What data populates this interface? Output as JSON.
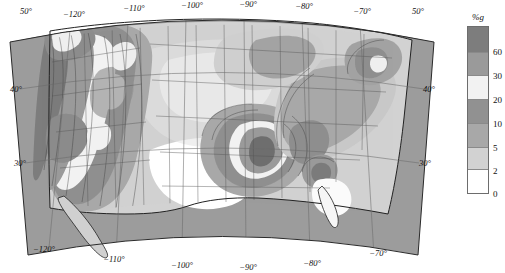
{
  "figure": {
    "kind": "seismic-hazard-map",
    "projection": "lambert-conformal-conic",
    "region": "contiguous-united-states"
  },
  "legend": {
    "title": "%g",
    "tick_labels": [
      "60",
      "30",
      "20",
      "10",
      "5",
      "2",
      "0"
    ],
    "bands": [
      {
        "label": ">60",
        "upper": null,
        "lower": 60,
        "color": "#7d7d7d",
        "height_px": 26
      },
      {
        "label": "30-60",
        "upper": 60,
        "lower": 30,
        "color": "#9a9a9a",
        "height_px": 24
      },
      {
        "label": "20-30",
        "upper": 30,
        "lower": 20,
        "color": "#f2f2f2",
        "height_px": 24
      },
      {
        "label": "10-20",
        "upper": 20,
        "lower": 10,
        "color": "#919191",
        "height_px": 24
      },
      {
        "label": "5-10",
        "upper": 10,
        "lower": 5,
        "color": "#a8a8a8",
        "height_px": 24
      },
      {
        "label": "2-5",
        "upper": 5,
        "lower": 2,
        "color": "#d2d2d2",
        "height_px": 23
      },
      {
        "label": "0-2",
        "upper": 2,
        "lower": 0,
        "color": "#ffffff",
        "height_px": 23
      }
    ]
  },
  "axes": {
    "top_labels": [
      "50°",
      "−120°",
      "−110°",
      "−100°",
      "−90°",
      "−80°",
      "−70°",
      "50°"
    ],
    "bottom_labels": [
      "−120°",
      "−110°",
      "−100°",
      "−90°",
      "−80°",
      "−70°"
    ],
    "left_labels": [
      "40°",
      "30°"
    ],
    "right_labels": [
      "40°",
      "30°"
    ],
    "longitude_ticks": [
      -120,
      -110,
      -100,
      -90,
      -80,
      -70
    ],
    "latitude_ticks": [
      30,
      40,
      50
    ]
  },
  "chart_data": {
    "type": "heatmap",
    "title": "",
    "xlabel": "",
    "ylabel": "",
    "units": "%g",
    "variable": "peak-ground-acceleration",
    "contour_levels": [
      0,
      2,
      5,
      10,
      20,
      30,
      60
    ],
    "colors": [
      "#ffffff",
      "#d2d2d2",
      "#a8a8a8",
      "#919191",
      "#f2f2f2",
      "#9a9a9a",
      "#7d7d7d"
    ],
    "ocean_color": "#9c9c9c",
    "grid": true,
    "legend_position": "right",
    "hazard_zones": [
      {
        "name": "coastal-california-san-andreas",
        "peak_band": ">60",
        "lon": -121.5,
        "lat": 37.0
      },
      {
        "name": "southern-california",
        "peak_band": ">60",
        "lon": -117.5,
        "lat": 34.0
      },
      {
        "name": "cascadia-pacific-northwest",
        "peak_band": "30-60",
        "lon": -123.0,
        "lat": 46.5
      },
      {
        "name": "nevada-basin-and-range",
        "peak_band": "20-30",
        "lon": -117.0,
        "lat": 39.0
      },
      {
        "name": "wasatch-front-utah",
        "peak_band": "20-30",
        "lon": -111.8,
        "lat": 40.5
      },
      {
        "name": "intermountain-seismic-belt",
        "peak_band": "10-20",
        "lon": -112.5,
        "lat": 44.0
      },
      {
        "name": "new-madrid-seismic-zone",
        "peak_band": ">60",
        "lon": -89.5,
        "lat": 36.3
      },
      {
        "name": "charleston-south-carolina",
        "peak_band": "30-60",
        "lon": -80.0,
        "lat": 32.8
      },
      {
        "name": "eastern-tennessee",
        "peak_band": "10-20",
        "lon": -84.0,
        "lat": 36.0
      },
      {
        "name": "new-england-adirondacks",
        "peak_band": "5-10",
        "lon": -73.5,
        "lat": 44.0
      },
      {
        "name": "central-texas-low",
        "peak_band": "0-2",
        "lon": -99.0,
        "lat": 31.0
      },
      {
        "name": "florida-low",
        "peak_band": "0-2",
        "lon": -81.5,
        "lat": 28.5
      },
      {
        "name": "great-plains-low",
        "peak_band": "2-5",
        "lon": -100.0,
        "lat": 41.0
      }
    ]
  }
}
